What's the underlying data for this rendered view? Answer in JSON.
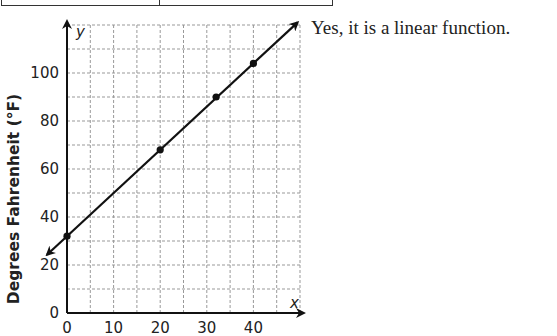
{
  "answer_text": "Yes, it is a linear function.",
  "chart_data": {
    "type": "line",
    "title": "",
    "xlabel": "",
    "ylabel": "Degrees Fahrenheit (°F)",
    "x_axis_var": "x",
    "y_axis_var": "y",
    "xlim": [
      0,
      50
    ],
    "ylim": [
      0,
      120
    ],
    "x_ticks": [
      0,
      10,
      20,
      30,
      40
    ],
    "y_ticks": [
      0,
      20,
      40,
      60,
      80,
      100
    ],
    "grid": true,
    "grid_step": {
      "x": 5,
      "y": 10
    },
    "series": [
      {
        "name": "Fahrenheit vs Celsius",
        "points": [
          {
            "x": 0,
            "y": 32
          },
          {
            "x": 20,
            "y": 68
          },
          {
            "x": 32,
            "y": 90
          },
          {
            "x": 40,
            "y": 104
          }
        ],
        "line_extends_both_directions": true
      }
    ],
    "legend": null
  },
  "colors": {
    "line": "#111111",
    "grid": "#999999",
    "text": "#222222"
  }
}
